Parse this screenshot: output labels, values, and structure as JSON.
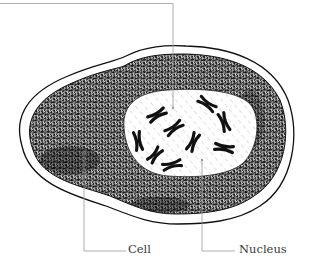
{
  "diagram": {
    "style": "pen-and-ink illustration",
    "colors": {
      "ink": "#111111",
      "leader_line": "#9a9a9a",
      "label_text": "#3a3a3a",
      "background": "#ffffff"
    },
    "labels": [
      {
        "id": "cell",
        "text": "Cell"
      },
      {
        "id": "nucleus",
        "text": "Nucleus"
      }
    ],
    "top_leader": {
      "text": ""
    },
    "chromosome_count": 10
  }
}
